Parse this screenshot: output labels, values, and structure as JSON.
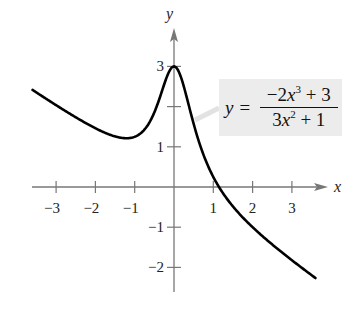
{
  "chart_data": {
    "type": "line",
    "title": "",
    "xlabel": "x",
    "ylabel": "y",
    "function": "y = (-2x^3 + 3) / (3x^2 + 1)",
    "xlim": [
      -3.6,
      3.6
    ],
    "ylim": [
      -2.5,
      3.5
    ],
    "grid": false,
    "x_ticks": [
      -3,
      -2,
      -1,
      1,
      2,
      3
    ],
    "x_tick_labels": [
      "−3",
      "−2",
      "−1",
      "1",
      "2",
      "3"
    ],
    "y_ticks": [
      -2,
      -1,
      1,
      2,
      3
    ],
    "y_tick_labels": [
      "−2",
      "−1",
      "1",
      "",
      "3"
    ],
    "series": [
      {
        "name": "y = (-2x^3 + 3)/(3x^2 + 1)",
        "color": "#000000",
        "x": [
          -3.6,
          -3,
          -2.5,
          -2,
          -1.5,
          -1.2,
          -1,
          -0.75,
          -0.5,
          -0.25,
          0,
          0.25,
          0.5,
          0.75,
          1,
          1.1,
          1.5,
          2,
          2.5,
          3,
          3.6
        ],
        "y": [
          2.41,
          2.18,
          1.98,
          1.46,
          1.33,
          1.22,
          1.25,
          1.54,
          2.0,
          2.65,
          3.0,
          2.58,
          1.57,
          0.98,
          0.25,
          0.11,
          -0.03,
          -0.38,
          -0.86,
          -1.82,
          -2.26
        ]
      }
    ],
    "annotations": [
      {
        "text": "y = (−2x³ + 3)/(3x² + 1)",
        "position": "upper right, with pointer to curve near x≈0.2"
      }
    ],
    "extrema": {
      "local_max": {
        "x": 0,
        "y": 3
      },
      "local_min": {
        "x": -1.1,
        "y": 1.2
      }
    },
    "x_intercept": 1.14
  },
  "axes": {
    "x_label": "x",
    "y_label": "y",
    "axis_color": "#777777",
    "curve_color": "#000000"
  },
  "equation": {
    "lhs": "y = ",
    "num_a": "−2",
    "num_var": "x",
    "num_exp": "3",
    "num_b": " + 3",
    "den_a": "3",
    "den_var": "x",
    "den_exp": "2",
    "den_b": " + 1",
    "box_color": "#ececec"
  }
}
